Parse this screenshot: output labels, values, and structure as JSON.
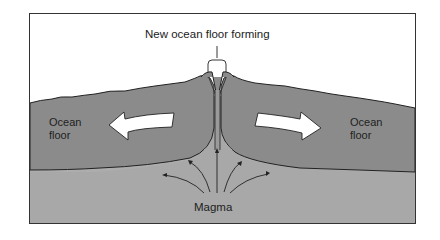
{
  "diagram": {
    "title_label": "New ocean floor forming",
    "left_label_line1": "Ocean",
    "left_label_line2": "floor",
    "right_label_line1": "Ocean",
    "right_label_line2": "floor",
    "bottom_label": "Magma"
  },
  "colors": {
    "plate": "#8b8b8b",
    "magma": "#a8a8a8",
    "arrow_fill": "#ffffff",
    "outline": "#222222",
    "background": "#ffffff"
  }
}
